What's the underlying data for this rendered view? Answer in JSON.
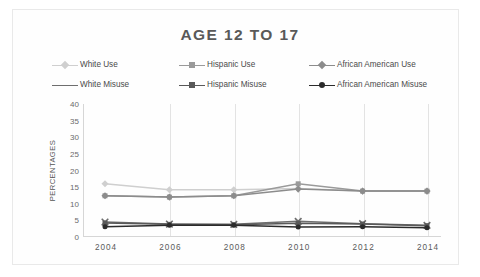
{
  "chart_data": {
    "type": "line",
    "title": "AGE 12 TO 17",
    "xlabel": "",
    "ylabel": "PERCENTAGES",
    "categories": [
      "2004",
      "2006",
      "2008",
      "2010",
      "2012",
      "2014"
    ],
    "x": [
      2004,
      2006,
      2008,
      2010,
      2012,
      2014
    ],
    "ylim": [
      0,
      40
    ],
    "yticks": [
      0,
      5,
      10,
      15,
      20,
      25,
      30,
      35,
      40
    ],
    "grid": "vertical",
    "legend_position": "top",
    "series": [
      {
        "name": "White Use",
        "color": "#cfcfcf",
        "marker": "diamond",
        "values": [
          16.0,
          14.2,
          14.2,
          14.6,
          13.8,
          13.8
        ]
      },
      {
        "name": "Hispanic Use",
        "color": "#9a9a9a",
        "marker": "square",
        "values": [
          12.4,
          12.0,
          12.4,
          16.0,
          13.8,
          13.8
        ]
      },
      {
        "name": "African American Use",
        "color": "#8c8c8c",
        "marker": "diamond",
        "values": [
          12.4,
          12.0,
          12.4,
          14.4,
          13.8,
          13.8
        ]
      },
      {
        "name": "White Misuse",
        "color": "#6e6e6e",
        "marker": "x",
        "values": [
          4.5,
          3.9,
          3.8,
          4.7,
          4.0,
          3.5
        ]
      },
      {
        "name": "Hispanic Misuse",
        "color": "#595959",
        "marker": "square",
        "values": [
          4.2,
          3.8,
          3.7,
          4.1,
          3.9,
          3.4
        ]
      },
      {
        "name": "African American Misuse",
        "color": "#2b2b2b",
        "marker": "circle",
        "values": [
          3.1,
          3.5,
          3.5,
          3.0,
          3.1,
          2.8
        ]
      }
    ]
  },
  "legend": {
    "items": [
      {
        "label": "White Use"
      },
      {
        "label": "Hispanic Use"
      },
      {
        "label": "African American Use"
      },
      {
        "label": "White Misuse"
      },
      {
        "label": "Hispanic Misuse"
      },
      {
        "label": "African American Misuse"
      }
    ]
  }
}
